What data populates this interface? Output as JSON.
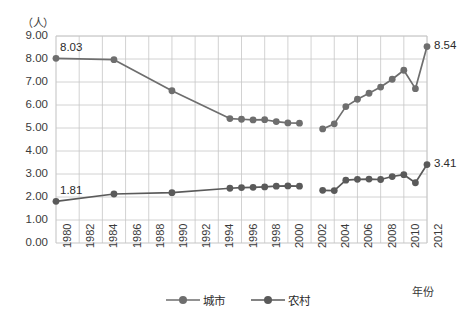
{
  "chart_data": {
    "type": "line",
    "title": "",
    "subtitle": "",
    "xlabel": "年份",
    "ylabel": "（人）",
    "ylim": [
      0,
      9
    ],
    "ytick_step": 1,
    "ytick_labels": [
      "0.00",
      "1.00",
      "2.00",
      "3.00",
      "4.00",
      "5.00",
      "6.00",
      "7.00",
      "8.00",
      "9.00"
    ],
    "xlim": [
      1980,
      2012
    ],
    "xtick_labels": [
      "1980",
      "1982",
      "1984",
      "1986",
      "1988",
      "1990",
      "1992",
      "1994",
      "1996",
      "1998",
      "2000",
      "2002",
      "2004",
      "2006",
      "2008",
      "2010",
      "2012"
    ],
    "grid": true,
    "legend_position": "bottom-center",
    "series": [
      {
        "name": "城市",
        "color": "#6e6e6e",
        "points": [
          {
            "x": 1980,
            "y": 8.03
          },
          {
            "x": 1985,
            "y": 7.97
          },
          {
            "x": 1990,
            "y": 6.62
          },
          {
            "x": 1995,
            "y": 5.41
          },
          {
            "x": 1996,
            "y": 5.38
          },
          {
            "x": 1997,
            "y": 5.35
          },
          {
            "x": 1998,
            "y": 5.36
          },
          {
            "x": 1999,
            "y": 5.28
          },
          {
            "x": 2000,
            "y": 5.22
          },
          {
            "x": 2001,
            "y": 5.21
          },
          {
            "x": 2003,
            "y": 4.96
          },
          {
            "x": 2004,
            "y": 5.18
          },
          {
            "x": 2005,
            "y": 5.93
          },
          {
            "x": 2006,
            "y": 6.25
          },
          {
            "x": 2007,
            "y": 6.51
          },
          {
            "x": 2008,
            "y": 6.78
          },
          {
            "x": 2009,
            "y": 7.12
          },
          {
            "x": 2010,
            "y": 7.51
          },
          {
            "x": 2011,
            "y": 6.71
          },
          {
            "x": 2012,
            "y": 8.54
          }
        ]
      },
      {
        "name": "农村",
        "color": "#5a5a5a",
        "points": [
          {
            "x": 1980,
            "y": 1.81
          },
          {
            "x": 1985,
            "y": 2.13
          },
          {
            "x": 1990,
            "y": 2.19
          },
          {
            "x": 1995,
            "y": 2.38
          },
          {
            "x": 1996,
            "y": 2.41
          },
          {
            "x": 1997,
            "y": 2.42
          },
          {
            "x": 1998,
            "y": 2.44
          },
          {
            "x": 1999,
            "y": 2.47
          },
          {
            "x": 2000,
            "y": 2.48
          },
          {
            "x": 2001,
            "y": 2.47
          },
          {
            "x": 2003,
            "y": 2.29
          },
          {
            "x": 2004,
            "y": 2.28
          },
          {
            "x": 2005,
            "y": 2.73
          },
          {
            "x": 2006,
            "y": 2.77
          },
          {
            "x": 2007,
            "y": 2.78
          },
          {
            "x": 2008,
            "y": 2.76
          },
          {
            "x": 2009,
            "y": 2.89
          },
          {
            "x": 2010,
            "y": 2.97
          },
          {
            "x": 2011,
            "y": 2.62
          },
          {
            "x": 2012,
            "y": 3.41
          }
        ]
      }
    ],
    "annotations": [
      {
        "text": "8.03",
        "x": 1980,
        "y": 8.03,
        "series": "城市"
      },
      {
        "text": "1.81",
        "x": 1980,
        "y": 1.81,
        "series": "农村"
      },
      {
        "text": "8.54",
        "x": 2012,
        "y": 8.54,
        "series": "城市"
      },
      {
        "text": "3.41",
        "x": 2012,
        "y": 3.41,
        "series": "农村"
      }
    ]
  },
  "legend": {
    "items": [
      {
        "label": "城市"
      },
      {
        "label": "农村"
      }
    ]
  },
  "axes": {
    "y_unit": "（人）",
    "x_title": "年份"
  }
}
